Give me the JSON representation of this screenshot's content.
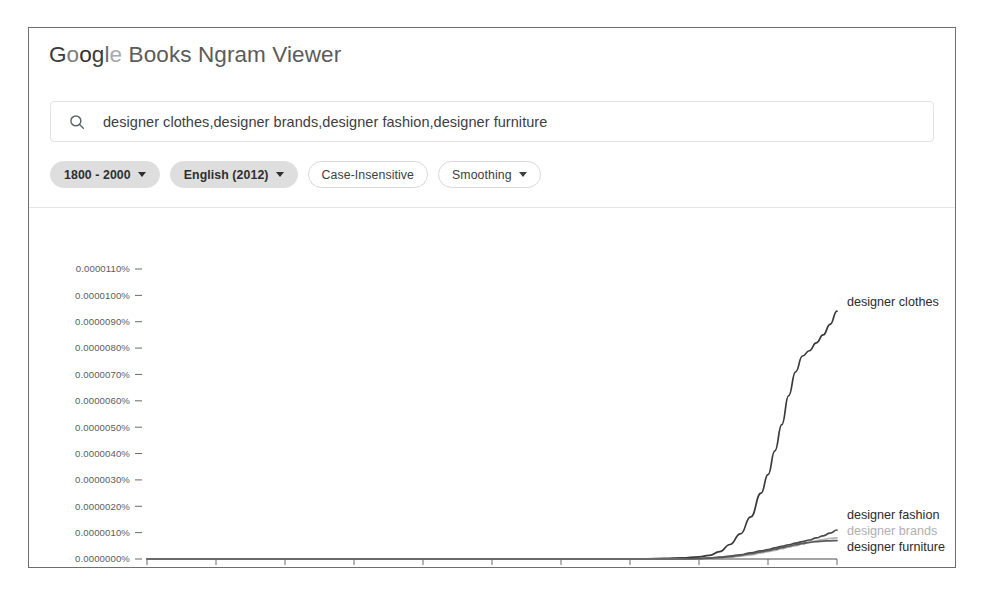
{
  "app": {
    "title_brand_letters": [
      "G",
      "o",
      "o",
      "g",
      "l",
      "e"
    ],
    "title_rest": " Books Ngram Viewer",
    "title_full": "Google Books Ngram Viewer"
  },
  "search": {
    "icon": "search-icon",
    "value": "designer clothes,designer brands,designer fashion,designer furniture",
    "placeholder": "Enter comma-separated phrases"
  },
  "chips": [
    {
      "label": "1800 - 2000",
      "style": "filled",
      "has_caret": true
    },
    {
      "label": "English (2012)",
      "style": "filled",
      "has_caret": true
    },
    {
      "label": "Case-Insensitive",
      "style": "outlined",
      "has_caret": false
    },
    {
      "label": "Smoothing",
      "style": "outlined",
      "has_caret": true
    }
  ],
  "chart_data": {
    "type": "line",
    "title": "",
    "xlabel": "",
    "ylabel": "",
    "xlim": [
      1800,
      2000
    ],
    "ylim": [
      0.0,
      1.1e-05
    ],
    "grid": false,
    "legend_position": "right-inline",
    "x_ticks": [
      1800,
      1820,
      1840,
      1860,
      1880,
      1900,
      1920,
      1940,
      1960,
      1980,
      2000
    ],
    "y_ticks": [
      "0.0000000%",
      "0.0000010%",
      "0.0000020%",
      "0.0000030%",
      "0.0000040%",
      "0.0000050%",
      "0.0000060%",
      "0.0000070%",
      "0.0000080%",
      "0.0000090%",
      "0.0000100%",
      "0.0000110%"
    ],
    "y_tick_values": [
      0.0,
      1e-06,
      2e-06,
      3e-06,
      4e-06,
      5e-06,
      6e-06,
      7e-06,
      8e-06,
      9e-06,
      1e-05,
      1.1e-05
    ],
    "x": [
      1800,
      1810,
      1820,
      1830,
      1840,
      1850,
      1860,
      1870,
      1880,
      1890,
      1900,
      1910,
      1920,
      1930,
      1940,
      1950,
      1955,
      1960,
      1963,
      1966,
      1969,
      1972,
      1975,
      1978,
      1980,
      1982,
      1984,
      1986,
      1988,
      1990,
      1992,
      1994,
      1996,
      1998,
      2000
    ],
    "series": [
      {
        "name": "designer clothes",
        "color": "#3a3a3a",
        "label_color": "#2b2b2b",
        "values": [
          0.0,
          0.0,
          0.0,
          0.0,
          0.0,
          0.0,
          0.0,
          0.0,
          0.0,
          0.0,
          0.0,
          0.0,
          0.0,
          0.0,
          0.0,
          2e-08,
          4e-08,
          8e-08,
          1.4e-07,
          2.8e-07,
          5.5e-07,
          9.5e-07,
          1.6e-06,
          2.5e-06,
          3.2e-06,
          4.1e-06,
          5.1e-06,
          6.2e-06,
          7.1e-06,
          7.7e-06,
          7.9e-06,
          8.2e-06,
          8.5e-06,
          8.9e-06,
          9.4e-06
        ]
      },
      {
        "name": "designer fashion",
        "color": "#4a4a4a",
        "label_color": "#2b2b2b",
        "values": [
          0.0,
          0.0,
          0.0,
          0.0,
          0.0,
          0.0,
          0.0,
          0.0,
          0.0,
          0.0,
          0.0,
          0.0,
          0.0,
          0.0,
          0.0,
          0.0,
          0.0,
          2e-08,
          4e-08,
          7e-08,
          1.1e-07,
          1.6e-07,
          2.3e-07,
          3.1e-07,
          3.6e-07,
          4.2e-07,
          4.8e-07,
          5.4e-07,
          6e-07,
          6.6e-07,
          7.2e-07,
          8e-07,
          8.8e-07,
          9.8e-07,
          1.1e-06
        ]
      },
      {
        "name": "designer brands",
        "color": "#b4b4b4",
        "label_color": "#b0b0b0",
        "values": [
          0.0,
          0.0,
          0.0,
          0.0,
          0.0,
          0.0,
          0.0,
          0.0,
          0.0,
          0.0,
          0.0,
          0.0,
          0.0,
          0.0,
          0.0,
          0.0,
          0.0,
          1e-08,
          2e-08,
          4e-08,
          7e-08,
          1.1e-07,
          1.6e-07,
          2.3e-07,
          2.8e-07,
          3.3e-07,
          3.9e-07,
          4.5e-07,
          5.1e-07,
          5.7e-07,
          6.3e-07,
          6.9e-07,
          7.4e-07,
          7.8e-07,
          8e-07
        ]
      },
      {
        "name": "designer furniture",
        "color": "#5a5a5a",
        "label_color": "#2b2b2b",
        "values": [
          0.0,
          0.0,
          0.0,
          0.0,
          0.0,
          0.0,
          0.0,
          0.0,
          0.0,
          0.0,
          0.0,
          0.0,
          0.0,
          0.0,
          0.0,
          0.0,
          0.0,
          1e-08,
          3e-08,
          5e-08,
          9e-08,
          1.4e-07,
          2e-07,
          2.7e-07,
          3.2e-07,
          3.7e-07,
          4.3e-07,
          4.9e-07,
          5.4e-07,
          5.9e-07,
          6.3e-07,
          6.6e-07,
          6.8e-07,
          6.9e-07,
          7e-07
        ]
      }
    ],
    "annotations": [
      {
        "text": "designer clothes",
        "x_px": 818,
        "y_px": 92,
        "muted": false
      },
      {
        "text": "designer fashion",
        "x_px": 818,
        "y_px": 305,
        "muted": false
      },
      {
        "text": "designer brands",
        "x_px": 818,
        "y_px": 321,
        "muted": true
      },
      {
        "text": "designer furniture",
        "x_px": 818,
        "y_px": 337,
        "muted": false
      }
    ]
  }
}
